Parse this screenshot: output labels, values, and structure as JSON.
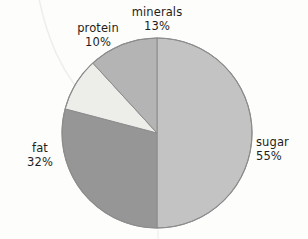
{
  "chart_data": {
    "type": "pie",
    "title": "",
    "subtitle": "",
    "xlabel": "",
    "ylabel": "",
    "legend_position": "none",
    "grid": false,
    "labels_outside": true,
    "start_angle_deg": 0,
    "direction": "clockwise",
    "categories": [
      "sugar",
      "fat",
      "protein",
      "minerals"
    ],
    "values": [
      55,
      32,
      10,
      13
    ],
    "units": "%",
    "slices": [
      {
        "label": "sugar",
        "value": 55,
        "display": "55%",
        "color": "#c3c3c3",
        "start_deg": 0,
        "end_deg": 198
      },
      {
        "label": "fat",
        "value": 32,
        "display": "32%",
        "color": "#969696",
        "start_deg": 198,
        "end_deg": 313.2
      },
      {
        "label": "protein",
        "value": 10,
        "display": "10%",
        "color": "#ededea",
        "start_deg": 313.2,
        "end_deg": 349.2
      },
      {
        "label": "minerals",
        "value": 13,
        "display": "13%",
        "color": "#b4b4b4",
        "start_deg": 349.2,
        "end_deg": 360
      }
    ],
    "annotations": []
  },
  "labels": {
    "minerals": {
      "name": "minerals",
      "percent": "13%"
    },
    "protein": {
      "name": "protein",
      "percent": "10%"
    },
    "sugar": {
      "name": "sugar",
      "percent": "55%"
    },
    "fat": {
      "name": "fat",
      "percent": "32%"
    }
  },
  "style": {
    "background": "#fdfdfc",
    "outline": "#8c8c8c",
    "text": "#1d1d1b"
  }
}
